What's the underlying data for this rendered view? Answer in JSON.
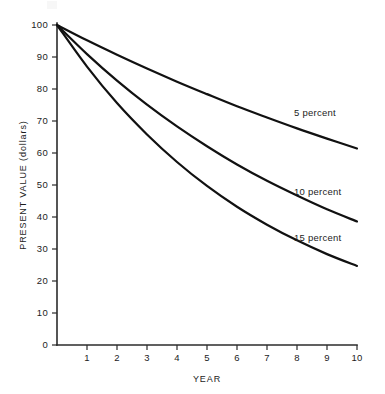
{
  "chart_data": {
    "type": "line",
    "title": "",
    "xlabel": "YEAR",
    "ylabel": "PRESENT VALUE (dollars)",
    "xlim": [
      0,
      10
    ],
    "ylim": [
      0,
      100
    ],
    "grid": false,
    "legend_position": "inline-right",
    "x": [
      0,
      1,
      2,
      3,
      4,
      5,
      6,
      7,
      8,
      9,
      10
    ],
    "x_tick_labels": [
      "1",
      "2",
      "3",
      "4",
      "5",
      "6",
      "7",
      "8",
      "9",
      "10"
    ],
    "x_tick_values": [
      1,
      2,
      3,
      4,
      5,
      6,
      7,
      8,
      9,
      10
    ],
    "y_tick_labels": [
      "0",
      "10",
      "20",
      "30",
      "40",
      "50",
      "60",
      "70",
      "80",
      "90",
      "100"
    ],
    "y_tick_values": [
      0,
      10,
      20,
      30,
      40,
      50,
      60,
      70,
      80,
      90,
      100
    ],
    "series": [
      {
        "name": "5 percent",
        "label": "5 percent",
        "label_x": 7.9,
        "label_y": 71.5,
        "values": [
          100.0,
          95.2,
          90.7,
          86.4,
          82.3,
          78.4,
          74.6,
          71.1,
          67.7,
          64.5,
          61.4
        ]
      },
      {
        "name": "10 percent",
        "label": "10 percent",
        "label_x": 7.9,
        "label_y": 47.0,
        "values": [
          100.0,
          90.9,
          82.6,
          75.1,
          68.3,
          62.1,
          56.4,
          51.3,
          46.7,
          42.4,
          38.6
        ]
      },
      {
        "name": "15 percent",
        "label": "15 percent",
        "label_x": 7.9,
        "label_y": 32.5,
        "values": [
          100.0,
          87.0,
          75.6,
          65.8,
          57.2,
          49.7,
          43.2,
          37.6,
          32.7,
          28.4,
          24.7
        ]
      }
    ]
  },
  "colors": {
    "background": "#ffffff",
    "axis": "#2b2b2b",
    "curve": "#111111",
    "text": "#1c1c1c"
  }
}
